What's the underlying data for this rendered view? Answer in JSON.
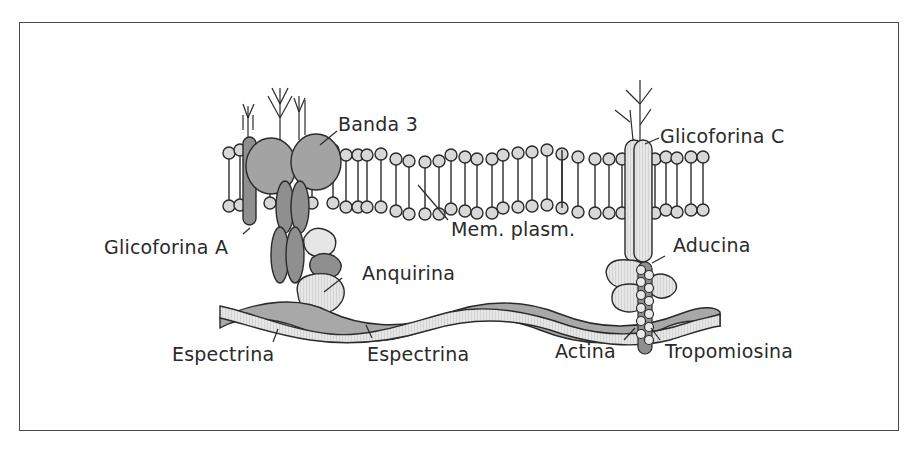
{
  "figure": {
    "colors": {
      "frame": "#4a4a4a",
      "protein_dark": "#8f8f8f",
      "protein_mid": "#a3a3a3",
      "protein_light": "#e4e4e4",
      "lipid_head": "#d6d6d6",
      "outline": "#2a2a2a"
    },
    "labels": {
      "banda3": "Banda 3",
      "glicoforina_a": "Glicoforina A",
      "glicoforina_c": "Glicoforina C",
      "mem_plasm": "Mem. plasm.",
      "aducina": "Aducina",
      "anquirina": "Anquirina",
      "espectrina_1": "Espectrina",
      "espectrina_2": "Espectrina",
      "actina": "Actina",
      "tropomiosina": "Tropomiosina"
    }
  }
}
